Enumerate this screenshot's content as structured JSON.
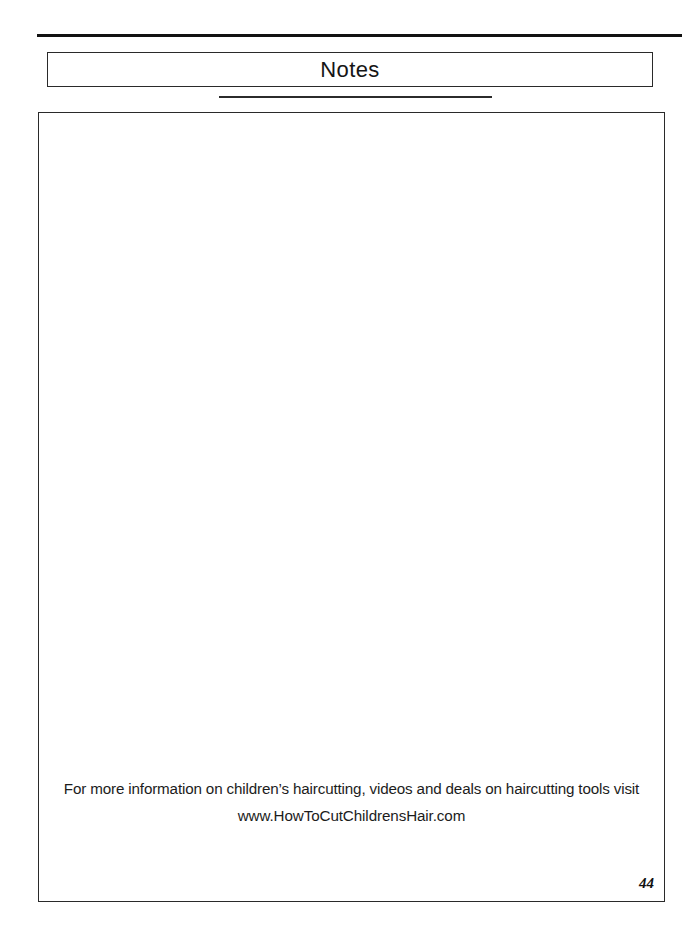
{
  "document": {
    "section_title": "Notes",
    "page_number": "44"
  },
  "footer": {
    "line1": "For more information on children’s haircutting, videos and deals on haircutting tools visit",
    "line2": "www.HowToCutChildrensHair.com"
  },
  "notes_area": {
    "content": ""
  }
}
